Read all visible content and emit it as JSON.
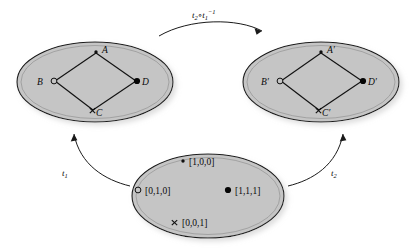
{
  "figure": {
    "type": "commutative-diagram",
    "background_color": "#ffffff",
    "region_fill_color": "#c5c5c5",
    "region_stroke_color": "#1a1a1a",
    "ink_color": "#0a0a0a"
  },
  "regions": {
    "left_chart": {
      "name": "left-chart-ellipse",
      "points": [
        {
          "id": "A",
          "label": "A",
          "marker": "dot-small",
          "label_side": "right"
        },
        {
          "id": "B",
          "label": "B",
          "marker": "circle-open",
          "label_side": "left"
        },
        {
          "id": "D",
          "label": "D",
          "marker": "dot-filled",
          "label_side": "right"
        },
        {
          "id": "C",
          "label": "C",
          "marker": "cross",
          "label_side": "right"
        }
      ],
      "edges": [
        {
          "from": "A",
          "to": "B"
        },
        {
          "from": "A",
          "to": "D"
        },
        {
          "from": "B",
          "to": "C"
        },
        {
          "from": "C",
          "to": "D"
        }
      ]
    },
    "right_chart": {
      "name": "right-chart-ellipse",
      "points": [
        {
          "id": "Ap",
          "label": "A′",
          "marker": "dot-small",
          "label_side": "right"
        },
        {
          "id": "Bp",
          "label": "B′",
          "marker": "circle-open",
          "label_side": "left"
        },
        {
          "id": "Dp",
          "label": "D′",
          "marker": "dot-filled",
          "label_side": "right"
        },
        {
          "id": "Cp",
          "label": "C′",
          "marker": "cross",
          "label_side": "right"
        }
      ],
      "edges": [
        {
          "from": "Ap",
          "to": "Bp"
        },
        {
          "from": "Ap",
          "to": "Dp"
        },
        {
          "from": "Bp",
          "to": "Cp"
        },
        {
          "from": "Cp",
          "to": "Dp"
        }
      ]
    },
    "bottom_space": {
      "name": "bottom-space-ellipse",
      "points": [
        {
          "id": "p100",
          "label": "[1,0,0]",
          "marker": "dot-small",
          "label_side": "right"
        },
        {
          "id": "p010",
          "label": "[0,1,0]",
          "marker": "circle-open",
          "label_side": "right"
        },
        {
          "id": "p111",
          "label": "[1,1,1]",
          "marker": "dot-filled",
          "label_side": "right"
        },
        {
          "id": "p001",
          "label": "[0,0,1]",
          "marker": "cross",
          "label_side": "right"
        }
      ],
      "edges": []
    }
  },
  "arrows": {
    "transition": {
      "name": "transition-map-arrow",
      "label_base": "t",
      "label_sub_1": "2",
      "label_op": "∘",
      "label_base_2": "t",
      "label_sub_2": "1",
      "label_sup_2": "−1",
      "label_full": "t₂∘t₁⁻¹",
      "direction": "left-chart-to-right-chart"
    },
    "t1": {
      "name": "t1-arrow",
      "label_base": "t",
      "label_sub": "1",
      "label_full": "t₁",
      "direction": "bottom-space-to-left-chart"
    },
    "t2": {
      "name": "t2-arrow",
      "label_base": "t",
      "label_sub": "2",
      "label_full": "t₂",
      "direction": "bottom-space-to-right-chart"
    }
  }
}
